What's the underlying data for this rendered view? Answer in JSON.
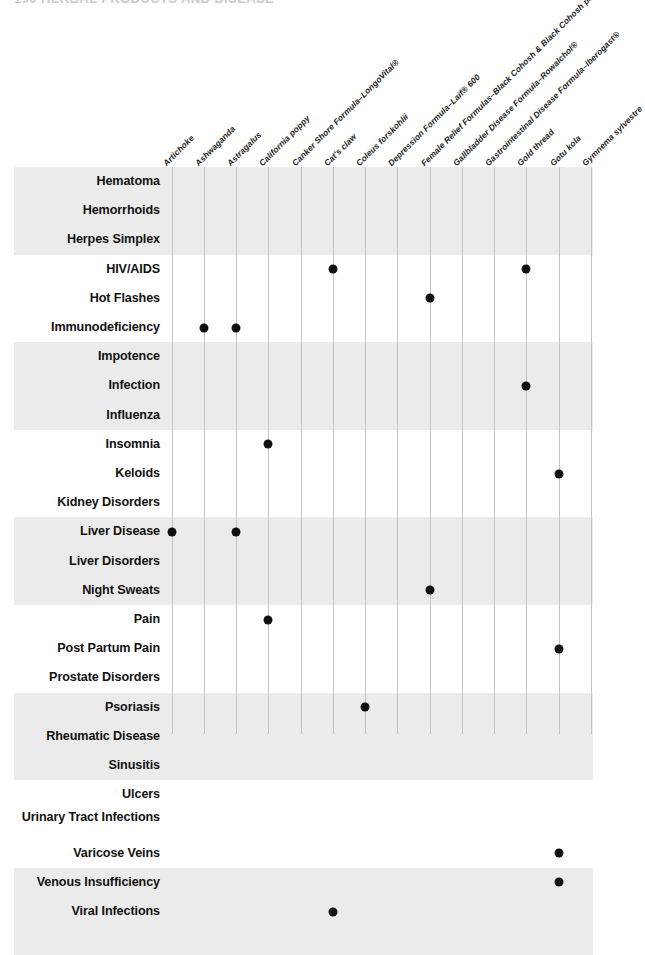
{
  "running_head": "190   HERBAL PRODUCTS AND DISEASE",
  "colors": {
    "band": "#ebebeb",
    "gridline": "#c3c3c8",
    "dot": "#111111",
    "text": "#111111"
  },
  "table": {
    "columns": [
      "Artichoke",
      "Ashwaganda",
      "Astragalus",
      "California poppy",
      "Canker Shore Formula–LongoVital®",
      "Cat's claw",
      "Coleus forskohlii",
      "Depression Formula–Laif® 600",
      "Female Relief Formulas–Black Cohosh & Black Cohosh plus St. John's Wort",
      "Gallbladder Disease Formula–Rowalchol®",
      "Gastrointestinal Disease Formula–Iberogast®",
      "Gold thread",
      "Gotu kola",
      "Gymnema sylvestre"
    ],
    "rows": [
      {
        "label": "Hematoma",
        "marks": []
      },
      {
        "label": "Hemorrhoids",
        "marks": []
      },
      {
        "label": "Herpes Simplex",
        "marks": []
      },
      {
        "label": "HIV/AIDS",
        "marks": [
          5,
          11
        ]
      },
      {
        "label": "Hot Flashes",
        "marks": [
          8
        ]
      },
      {
        "label": "Immunodeficiency",
        "marks": [
          1,
          2
        ]
      },
      {
        "label": "Impotence",
        "marks": []
      },
      {
        "label": "Infection",
        "marks": [
          11
        ]
      },
      {
        "label": "Influenza",
        "marks": []
      },
      {
        "label": "Insomnia",
        "marks": [
          3
        ]
      },
      {
        "label": "Keloids",
        "marks": [
          12
        ]
      },
      {
        "label": "Kidney Disorders",
        "marks": []
      },
      {
        "label": "Liver Disease",
        "marks": [
          0,
          2
        ]
      },
      {
        "label": "Liver Disorders",
        "marks": []
      },
      {
        "label": "Night Sweats",
        "marks": [
          8
        ]
      },
      {
        "label": "Pain",
        "marks": [
          3
        ]
      },
      {
        "label": "Post Partum Pain",
        "marks": [
          12
        ]
      },
      {
        "label": "Prostate Disorders",
        "marks": []
      },
      {
        "label": "Psoriasis",
        "marks": [
          6
        ]
      },
      {
        "label": "Rheumatic Disease",
        "marks": []
      },
      {
        "label": "Sinusitis",
        "marks": []
      },
      {
        "label": "Ulcers",
        "marks": []
      },
      {
        "label": "Urinary Tract Infections",
        "marks": [],
        "two_line": true
      },
      {
        "label": "Varicose Veins",
        "marks": [
          12
        ]
      },
      {
        "label": "Venous Insufficiency",
        "marks": [
          12
        ]
      },
      {
        "label": "Viral Infections",
        "marks": [
          5
        ]
      }
    ],
    "band_groups": [
      {
        "start_row": 0,
        "count": 3,
        "shaded": true
      },
      {
        "start_row": 3,
        "count": 3,
        "shaded": false
      },
      {
        "start_row": 6,
        "count": 3,
        "shaded": true
      },
      {
        "start_row": 9,
        "count": 3,
        "shaded": false
      },
      {
        "start_row": 12,
        "count": 3,
        "shaded": true
      },
      {
        "start_row": 15,
        "count": 3,
        "shaded": false
      },
      {
        "start_row": 18,
        "count": 3,
        "shaded": true
      },
      {
        "start_row": 21,
        "count": 3,
        "shaded": false
      },
      {
        "start_row": 24,
        "count": 3,
        "shaded": true
      }
    ]
  }
}
